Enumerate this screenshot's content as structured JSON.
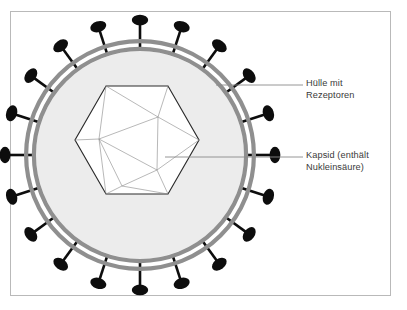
{
  "figure": {
    "frame": {
      "color": "#b9b9b9",
      "x": 10,
      "y": 11,
      "width": 380,
      "height": 284
    },
    "background_color": "#ffffff"
  },
  "labels": {
    "envelope": {
      "line1": "Hülle mit",
      "line2": "Rezeptoren",
      "leader_color": "#8a8a8a"
    },
    "capsid": {
      "line1": "Kapsid (enthält",
      "line2": "Nukleinsäure)",
      "leader_color": "#8a8a8a"
    }
  },
  "envelope": {
    "name": "viral-envelope",
    "center_x": 140,
    "center_y": 155,
    "outer_radius": 116,
    "inner_radius": 104,
    "ring_color": "#8f8f8f",
    "ring_gap_color": "#ffffff",
    "fill_color": "#ececec",
    "ring_stroke_width": 4.2
  },
  "spikes": {
    "name": "receptor-spikes",
    "count": 20,
    "color": "#0d0d0d",
    "head_rx": 8.2,
    "head_ry": 5.4,
    "stem_length": 26,
    "stem_width": 2.6,
    "start_angle_deg": -90
  },
  "capsid": {
    "name": "icosahedral-capsid",
    "outline_color": "#2a2a2a",
    "inner_line_color": "#8c8c8c",
    "fill_color": "#ffffff",
    "outline_width": 1.15,
    "inner_width": 0.62,
    "center_x": 137,
    "center_y": 140,
    "radius": 62,
    "vertices": [
      [
        106,
        86
      ],
      [
        168,
        86
      ],
      [
        199,
        140
      ],
      [
        168,
        194
      ],
      [
        106,
        194
      ],
      [
        75,
        140
      ]
    ],
    "inner_vertices": [
      [
        158,
        117
      ],
      [
        99,
        139
      ],
      [
        157,
        170
      ],
      [
        122,
        186
      ]
    ]
  },
  "chart_data": {
    "type": "diagram",
    "annotations": [
      {
        "label": "Hülle mit Rezeptoren",
        "target": "envelope"
      },
      {
        "label": "Kapsid (enthält Nukleinsäure)",
        "target": "capsid"
      }
    ],
    "elements": [
      {
        "name": "envelope",
        "shape": "double-ring circle",
        "spikes": 20
      },
      {
        "name": "capsid",
        "shape": "icosahedron projected as hexagon"
      }
    ]
  }
}
